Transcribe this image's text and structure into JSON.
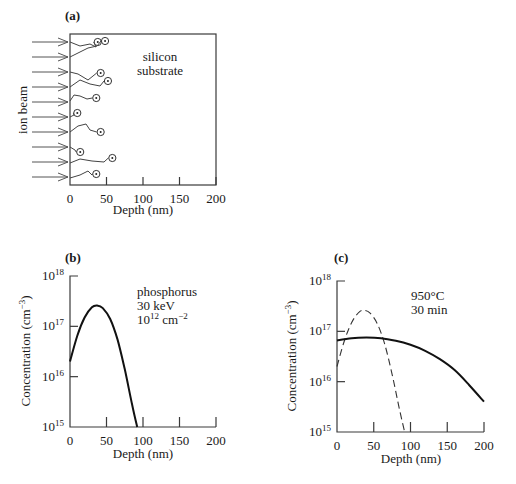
{
  "figure": {
    "panel_a": {
      "label": "(a)",
      "substrate_label_line1": "silicon",
      "substrate_label_line2": "substrate",
      "beam_label": "ion beam",
      "xlabel": "Depth (nm)",
      "xticks": [
        "0",
        "50",
        "100",
        "150",
        "200"
      ]
    },
    "panel_b": {
      "label": "(b)",
      "annotation_species": "phosphorus",
      "annotation_energy": "30 keV",
      "annotation_dose_base": "10",
      "annotation_dose_exp": "12",
      "annotation_dose_unit": " cm",
      "annotation_dose_unit_exp": "−2"
    },
    "panel_c": {
      "label": "(c)",
      "annotation_temp": "950°C",
      "annotation_time": "30 min"
    },
    "shared": {
      "xlabel": "Depth (nm)",
      "ylabel_main": "Concentration (cm",
      "ylabel_exp": "−3",
      "ylabel_close": ")",
      "ytick_base": "10",
      "ytick_exps": [
        "15",
        "16",
        "17",
        "18"
      ]
    }
  },
  "chart_data": [
    {
      "type": "diagram",
      "panel": "a",
      "title": "(a)",
      "xlabel": "Depth (nm)",
      "ylabel": "ion beam",
      "xlim": [
        0,
        200
      ],
      "xticks": [
        0,
        50,
        100,
        150,
        200
      ],
      "annotations": [
        "silicon substrate"
      ],
      "ion_count": 10,
      "ion_final_depths_nm": [
        [
          38,
          48
        ],
        [],
        [
          42
        ],
        [
          52
        ],
        [
          36
        ],
        [
          10
        ],
        [
          42
        ],
        [
          14
        ],
        [
          58
        ],
        [
          36
        ]
      ]
    },
    {
      "type": "line",
      "panel": "b",
      "title": "(b)",
      "xlabel": "Depth (nm)",
      "ylabel": "Concentration (cm^-3)",
      "yscale": "log",
      "xlim": [
        0,
        200
      ],
      "ylim": [
        1000000000000000.0,
        1e+18
      ],
      "xticks": [
        0,
        50,
        100,
        150,
        200
      ],
      "yticks": [
        1000000000000000.0,
        1e+16,
        1e+17,
        1e+18
      ],
      "annotations": [
        "phosphorus",
        "30 keV",
        "10^12 cm^-2"
      ],
      "series": [
        {
          "name": "as-implanted",
          "style": "solid",
          "x": [
            0,
            10,
            20,
            30,
            37,
            45,
            55,
            65,
            75,
            85,
            92
          ],
          "y": [
            2e+16,
            6.5e+16,
            1.5e+17,
            2.4e+17,
            2.6e+17,
            2.3e+17,
            1.4e+17,
            5.5e+16,
            1.4e+16,
            2800000000000000.0,
            1000000000000000.0
          ]
        }
      ]
    },
    {
      "type": "line",
      "panel": "c",
      "title": "(c)",
      "xlabel": "Depth (nm)",
      "ylabel": "Concentration (cm^-3)",
      "yscale": "log",
      "xlim": [
        0,
        200
      ],
      "ylim": [
        1000000000000000.0,
        1e+18
      ],
      "xticks": [
        0,
        50,
        100,
        150,
        200
      ],
      "yticks": [
        1000000000000000.0,
        1e+16,
        1e+17,
        1e+18
      ],
      "annotations": [
        "950°C",
        "30 min"
      ],
      "series": [
        {
          "name": "as-implanted",
          "style": "dashed",
          "x": [
            0,
            10,
            20,
            30,
            37,
            45,
            55,
            65,
            75,
            85,
            92
          ],
          "y": [
            2e+16,
            6.5e+16,
            1.5e+17,
            2.4e+17,
            2.6e+17,
            2.3e+17,
            1.4e+17,
            5.5e+16,
            1.4e+16,
            2800000000000000.0,
            1000000000000000.0
          ]
        },
        {
          "name": "after anneal 950°C 30 min",
          "style": "solid",
          "x": [
            0,
            20,
            40,
            60,
            80,
            100,
            120,
            140,
            160,
            180,
            200
          ],
          "y": [
            6.6e+16,
            7.3e+16,
            7.5e+16,
            7.3e+16,
            6.5e+16,
            5.4e+16,
            4.1e+16,
            2.8e+16,
            1.7e+16,
            8500000000000000.0,
            4000000000000000.0
          ]
        }
      ]
    }
  ]
}
